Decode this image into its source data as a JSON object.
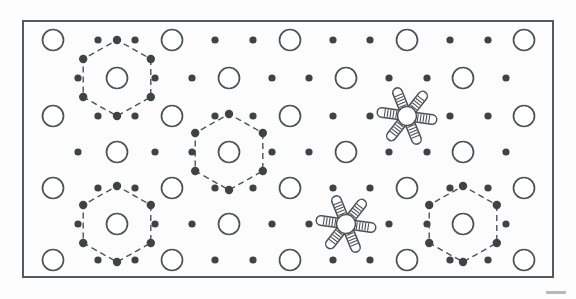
{
  "figure": {
    "title": "",
    "caption": "",
    "domain_type": "schematic-lattice-diagram",
    "background_color": "#fdfdfd",
    "frame": {
      "x": 22,
      "y": 20,
      "width": 532,
      "height": 258,
      "stroke_color": "#555a5e",
      "stroke_width": 2,
      "fill": "#fcfcfc"
    },
    "corner_mark": {
      "x": 546,
      "y": 291,
      "width": 20,
      "height": 3,
      "color": "#b9b9b9"
    }
  },
  "legend_semantics": {
    "open_circle": "large substrate atom (open circle outline)",
    "filled_dot": "small adatom / interstitial site (filled dot)",
    "dashed_hexagon": "unit cell highlight drawn through six nearest dot sites",
    "rotor": "six-armed hatched molecule adsorbed on lattice"
  },
  "style": {
    "open_circle_stroke": "#4c5155",
    "open_circle_fill": "#ffffff",
    "open_circle_stroke_width": 1.7,
    "open_circle_radius": 10.5,
    "dot_fill": "#3f4347",
    "dot_radius": 3.6,
    "hex_stroke": "#4c5155",
    "hex_stroke_width": 1.4,
    "hex_dash": "6,4",
    "hex_vertex_radius": 4.2,
    "rotor_stroke": "#4c5155",
    "rotor_fill": "#ffffff",
    "rotor_stroke_width": 1.5,
    "rotor_hub_radius": 9.5,
    "rotor_arm_length": 30,
    "rotor_arm_width": 9.5,
    "rotor_hatch_count": 5
  },
  "lattice": {
    "description": "Seven horizontal rows alternating between circle-dominant and dot-dominant registries.",
    "row_y": [
      40,
      78,
      116,
      152,
      188,
      224,
      260
    ],
    "column_pitch": 37.5,
    "rows": [
      {
        "index": 0,
        "y": 40,
        "items": [
          {
            "type": "circle",
            "x": 53
          },
          {
            "type": "dot",
            "x": 98
          },
          {
            "type": "dot",
            "x": 135
          },
          {
            "type": "circle",
            "x": 172
          },
          {
            "type": "dot",
            "x": 215
          },
          {
            "type": "dot",
            "x": 253
          },
          {
            "type": "circle",
            "x": 290
          },
          {
            "type": "dot",
            "x": 333
          },
          {
            "type": "dot",
            "x": 370
          },
          {
            "type": "circle",
            "x": 407
          },
          {
            "type": "dot",
            "x": 450
          },
          {
            "type": "dot",
            "x": 488
          },
          {
            "type": "circle",
            "x": 524
          }
        ]
      },
      {
        "index": 1,
        "y": 78,
        "items": [
          {
            "type": "dot",
            "x": 78
          },
          {
            "type": "circle",
            "x": 117
          },
          {
            "type": "dot",
            "x": 155
          },
          {
            "type": "dot",
            "x": 192
          },
          {
            "type": "circle",
            "x": 229
          },
          {
            "type": "dot",
            "x": 272
          },
          {
            "type": "dot",
            "x": 309
          },
          {
            "type": "circle",
            "x": 346
          },
          {
            "type": "dot",
            "x": 389
          },
          {
            "type": "dot",
            "x": 427
          },
          {
            "type": "circle",
            "x": 463
          },
          {
            "type": "dot",
            "x": 506
          }
        ]
      },
      {
        "index": 2,
        "y": 116,
        "items": [
          {
            "type": "circle",
            "x": 53
          },
          {
            "type": "dot",
            "x": 98
          },
          {
            "type": "dot",
            "x": 135
          },
          {
            "type": "circle",
            "x": 172
          },
          {
            "type": "dot",
            "x": 215
          },
          {
            "type": "dot",
            "x": 253
          },
          {
            "type": "circle",
            "x": 290
          },
          {
            "type": "dot",
            "x": 333
          },
          {
            "type": "dot",
            "x": 370
          },
          {
            "type": "rotor",
            "x": 407
          },
          {
            "type": "dot",
            "x": 450
          },
          {
            "type": "dot",
            "x": 488
          },
          {
            "type": "circle",
            "x": 524
          }
        ]
      },
      {
        "index": 3,
        "y": 152,
        "items": [
          {
            "type": "dot",
            "x": 78
          },
          {
            "type": "circle",
            "x": 117
          },
          {
            "type": "dot",
            "x": 155
          },
          {
            "type": "dot",
            "x": 192
          },
          {
            "type": "circle",
            "x": 229
          },
          {
            "type": "dot",
            "x": 272
          },
          {
            "type": "dot",
            "x": 309
          },
          {
            "type": "circle",
            "x": 346
          },
          {
            "type": "dot",
            "x": 389
          },
          {
            "type": "dot",
            "x": 427
          },
          {
            "type": "circle",
            "x": 463
          },
          {
            "type": "dot",
            "x": 506
          }
        ]
      },
      {
        "index": 4,
        "y": 188,
        "items": [
          {
            "type": "circle",
            "x": 53
          },
          {
            "type": "dot",
            "x": 98
          },
          {
            "type": "dot",
            "x": 135
          },
          {
            "type": "circle",
            "x": 172
          },
          {
            "type": "dot",
            "x": 215
          },
          {
            "type": "dot",
            "x": 253
          },
          {
            "type": "circle",
            "x": 290
          },
          {
            "type": "dot",
            "x": 333
          },
          {
            "type": "dot",
            "x": 370
          },
          {
            "type": "circle",
            "x": 407
          },
          {
            "type": "dot",
            "x": 450
          },
          {
            "type": "dot",
            "x": 488
          },
          {
            "type": "circle",
            "x": 524
          }
        ]
      },
      {
        "index": 5,
        "y": 224,
        "items": [
          {
            "type": "dot",
            "x": 78
          },
          {
            "type": "circle",
            "x": 117
          },
          {
            "type": "dot",
            "x": 155
          },
          {
            "type": "dot",
            "x": 192
          },
          {
            "type": "circle",
            "x": 229
          },
          {
            "type": "dot",
            "x": 272
          },
          {
            "type": "dot",
            "x": 309
          },
          {
            "type": "rotor",
            "x": 346
          },
          {
            "type": "dot",
            "x": 389
          },
          {
            "type": "dot",
            "x": 427
          },
          {
            "type": "circle",
            "x": 463
          },
          {
            "type": "dot",
            "x": 506
          }
        ]
      },
      {
        "index": 6,
        "y": 260,
        "items": [
          {
            "type": "circle",
            "x": 53
          },
          {
            "type": "dot",
            "x": 98
          },
          {
            "type": "dot",
            "x": 135
          },
          {
            "type": "circle",
            "x": 172
          },
          {
            "type": "dot",
            "x": 215
          },
          {
            "type": "dot",
            "x": 253
          },
          {
            "type": "circle",
            "x": 290
          },
          {
            "type": "dot",
            "x": 333
          },
          {
            "type": "dot",
            "x": 370
          },
          {
            "type": "circle",
            "x": 407
          },
          {
            "type": "dot",
            "x": 450
          },
          {
            "type": "dot",
            "x": 488
          },
          {
            "type": "circle",
            "x": 524
          }
        ]
      }
    ]
  },
  "hexagons": [
    {
      "id": "hexagon-top-left",
      "cx": 117,
      "cy": 78,
      "rx": 39,
      "ry": 38
    },
    {
      "id": "hexagon-center",
      "cx": 229,
      "cy": 152,
      "rx": 39,
      "ry": 38
    },
    {
      "id": "hexagon-bottom-left",
      "cx": 117,
      "cy": 224,
      "rx": 39,
      "ry": 38
    },
    {
      "id": "hexagon-bottom-right",
      "cx": 463,
      "cy": 224,
      "rx": 39,
      "ry": 38
    }
  ],
  "rotors": [
    {
      "id": "rotor-upper-right",
      "cx": 407,
      "cy": 116,
      "arms": 6,
      "rotation": 8
    },
    {
      "id": "rotor-lower-mid",
      "cx": 346,
      "cy": 224,
      "arms": 6,
      "rotation": 8
    }
  ]
}
